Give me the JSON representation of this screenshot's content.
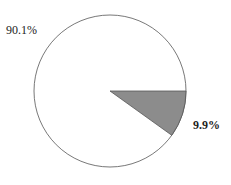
{
  "chart_data": {
    "type": "pie",
    "title": "",
    "labels": [
      "Other",
      "Highlighted"
    ],
    "values": [
      90.1,
      9.9
    ],
    "value_labels": [
      "90.1%",
      "9.9%"
    ],
    "colors": [
      "#ffffff",
      "#8c8c8c"
    ],
    "stroke": "#555555",
    "start_angle_deg": 0,
    "direction": "clockwise_from_3_oclock_for_small_slice",
    "legend": null
  },
  "labels": {
    "large": "90.1%",
    "small": "9.9%"
  }
}
